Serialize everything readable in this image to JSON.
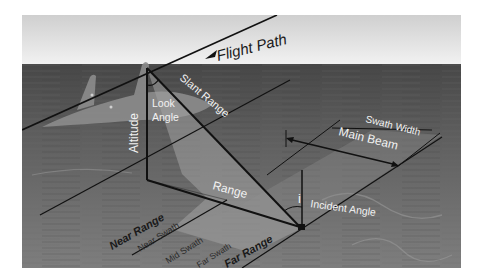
{
  "diagram": {
    "labels": {
      "flight_path": "Flight Path",
      "slant_range": "Slant Range",
      "look_angle_line1": "Look",
      "look_angle_line2": "Angle",
      "altitude": "Altitude",
      "range": "Range",
      "swath_width": "Swath Width",
      "main_beam": "Main Beam",
      "incident_symbol": "i",
      "incident_angle": "Incident Angle",
      "near_range": "Near Range",
      "near_swath": "Near Swath",
      "mid_swath": "Mid Swath",
      "far_swath": "Far Swath",
      "far_range": "Far Range"
    },
    "colors": {
      "sky_top": "#d4d4d4",
      "sky_bottom": "#f0f0f0",
      "ground_far": "#4e4e4e",
      "ground_near": "#7a7a7a",
      "beam_fill": "#9a9a9a",
      "aircraft": "#8c8c8c",
      "line": "#111111",
      "label_light": "#f2f2f2",
      "label_dark": "#1a1a1a"
    }
  }
}
